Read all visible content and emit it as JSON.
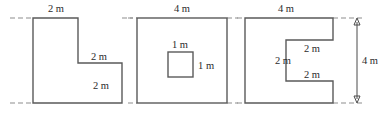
{
  "figure": {
    "unit": "m",
    "stroke_color": "#5a5a5a",
    "guide_color": "#8d8d8d",
    "background_color": "#ffffff"
  },
  "shapes": [
    {
      "id": "shape-1",
      "name": "l-shape",
      "description": "L-shaped polygon, step cut from upper right",
      "labels": [
        {
          "key": "top-width",
          "text": "2 m",
          "x": 56,
          "y": 12,
          "anchor": "middle"
        },
        {
          "key": "step-width",
          "text": "2 m",
          "x": 99,
          "y": 60,
          "anchor": "middle"
        },
        {
          "key": "right-height",
          "text": "2 m",
          "x": 101,
          "y": 89,
          "anchor": "middle"
        }
      ]
    },
    {
      "id": "shape-2",
      "name": "square-with-hole",
      "description": "Square with a small square hole in the centre",
      "labels": [
        {
          "key": "outer-width",
          "text": "4 m",
          "x": 182,
          "y": 12,
          "anchor": "middle"
        },
        {
          "key": "hole-width",
          "text": "1 m",
          "x": 180,
          "y": 48,
          "anchor": "middle"
        },
        {
          "key": "hole-height",
          "text": "1 m",
          "x": 198,
          "y": 69,
          "anchor": "start"
        }
      ]
    },
    {
      "id": "shape-3",
      "name": "c-shape",
      "description": "C-shaped polygon, rectangular notch cut from the right side",
      "labels": [
        {
          "key": "top-width",
          "text": "4 m",
          "x": 286,
          "y": 12,
          "anchor": "middle"
        },
        {
          "key": "notch-top",
          "text": "2 m",
          "x": 312,
          "y": 52,
          "anchor": "middle"
        },
        {
          "key": "notch-left",
          "text": "2 m",
          "x": 283,
          "y": 64,
          "anchor": "middle"
        },
        {
          "key": "notch-bottom",
          "text": "2 m",
          "x": 312,
          "y": 78,
          "anchor": "middle"
        },
        {
          "key": "overall-height",
          "text": "4 m",
          "x": 370,
          "y": 64,
          "anchor": "middle"
        }
      ]
    }
  ],
  "dimension_arrow": {
    "name": "overall-height-arrow",
    "text": "4 m"
  }
}
